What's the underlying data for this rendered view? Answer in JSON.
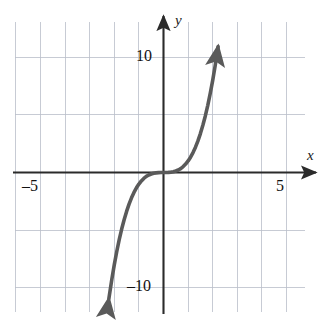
{
  "chart_data": {
    "type": "line",
    "title": "",
    "subtitle": "",
    "xlabel": "x",
    "ylabel": "y",
    "function": "y = x^3",
    "xlim": [
      -6,
      6
    ],
    "ylim": [
      -13,
      13
    ],
    "grid": true,
    "grid_step_x": 1,
    "grid_step_y": 5,
    "legend": "none",
    "axis_arrows": [
      "up",
      "right"
    ],
    "curve_arrows": [
      "start",
      "end"
    ],
    "x_tick_labels": [
      {
        "value": -5,
        "text": "–5"
      },
      {
        "value": 5,
        "text": "5"
      }
    ],
    "y_tick_labels": [
      {
        "value": 10,
        "text": "10"
      },
      {
        "value": -10,
        "text": "–10"
      }
    ],
    "series": [
      {
        "name": "y = x^3",
        "color": "#5a5a5a",
        "points": [
          {
            "x": -2.22,
            "y": -10.94
          },
          {
            "x": -2.1,
            "y": -9.26
          },
          {
            "x": -2.0,
            "y": -8.0
          },
          {
            "x": -1.9,
            "y": -6.86
          },
          {
            "x": -1.8,
            "y": -5.83
          },
          {
            "x": -1.7,
            "y": -4.91
          },
          {
            "x": -1.6,
            "y": -4.1
          },
          {
            "x": -1.5,
            "y": -3.38
          },
          {
            "x": -1.4,
            "y": -2.74
          },
          {
            "x": -1.3,
            "y": -2.2
          },
          {
            "x": -1.2,
            "y": -1.73
          },
          {
            "x": -1.1,
            "y": -1.33
          },
          {
            "x": -1.0,
            "y": -1.0
          },
          {
            "x": -0.9,
            "y": -0.73
          },
          {
            "x": -0.8,
            "y": -0.51
          },
          {
            "x": -0.7,
            "y": -0.34
          },
          {
            "x": -0.6,
            "y": -0.22
          },
          {
            "x": -0.5,
            "y": -0.13
          },
          {
            "x": -0.4,
            "y": -0.06
          },
          {
            "x": -0.3,
            "y": -0.03
          },
          {
            "x": -0.2,
            "y": -0.01
          },
          {
            "x": -0.1,
            "y": 0.0
          },
          {
            "x": 0.0,
            "y": 0.0
          },
          {
            "x": 0.1,
            "y": 0.0
          },
          {
            "x": 0.2,
            "y": 0.01
          },
          {
            "x": 0.3,
            "y": 0.03
          },
          {
            "x": 0.4,
            "y": 0.06
          },
          {
            "x": 0.5,
            "y": 0.13
          },
          {
            "x": 0.6,
            "y": 0.22
          },
          {
            "x": 0.7,
            "y": 0.34
          },
          {
            "x": 0.8,
            "y": 0.51
          },
          {
            "x": 0.9,
            "y": 0.73
          },
          {
            "x": 1.0,
            "y": 1.0
          },
          {
            "x": 1.1,
            "y": 1.33
          },
          {
            "x": 1.2,
            "y": 1.73
          },
          {
            "x": 1.3,
            "y": 2.2
          },
          {
            "x": 1.4,
            "y": 2.74
          },
          {
            "x": 1.5,
            "y": 3.38
          },
          {
            "x": 1.6,
            "y": 4.1
          },
          {
            "x": 1.7,
            "y": 4.91
          },
          {
            "x": 1.8,
            "y": 5.83
          },
          {
            "x": 1.9,
            "y": 6.86
          },
          {
            "x": 2.0,
            "y": 8.0
          },
          {
            "x": 2.1,
            "y": 9.26
          },
          {
            "x": 2.22,
            "y": 10.94
          }
        ]
      }
    ]
  },
  "figure": {
    "label_x": "x",
    "label_y": "y",
    "tick_x_neg5": "–5",
    "tick_x_5": "5",
    "tick_y_10": "10",
    "tick_y_neg10": "–10"
  },
  "colors": {
    "curve": "#5a5a5a",
    "axis": "#2b2b2b",
    "grid": "#b9bec9",
    "background": "#ffffff",
    "text": "#111111"
  }
}
